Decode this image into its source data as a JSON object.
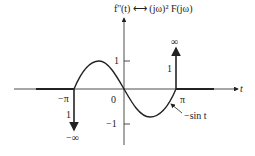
{
  "title": "f''(t) ⟷ (jω)² F(jω)",
  "axes": {
    "x_label": "t",
    "y_ticks": [
      "1",
      "−1"
    ]
  },
  "x_ticks": [
    "−π",
    "0",
    "π"
  ],
  "impulses": [
    {
      "position": "π",
      "weight": "1",
      "direction": "up",
      "label": "∞"
    },
    {
      "position": "−π",
      "weight": "1",
      "direction": "down",
      "label": "−∞"
    }
  ],
  "curve_label": "−sin t",
  "colors": {
    "ink": "#222222",
    "background": "#ffffff"
  }
}
